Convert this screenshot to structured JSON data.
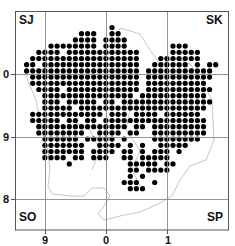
{
  "map": {
    "type": "grid-square distribution map",
    "square_labels": {
      "top_left": "SJ",
      "top_right": "SK",
      "bottom_left": "SO",
      "bottom_right": "SP"
    },
    "y_ticks": [
      {
        "label": "0",
        "y": 74
      },
      {
        "label": "9",
        "y": 137
      },
      {
        "label": "8",
        "y": 199
      }
    ],
    "x_ticks": [
      {
        "label": "9",
        "x": 45
      },
      {
        "label": "0",
        "x": 106
      },
      {
        "label": "1",
        "x": 167
      }
    ],
    "colors": {
      "dot": "#000000",
      "grid": "#8a8a8a",
      "frame": "#555555",
      "boundary": "#b5b5b5",
      "background": "#ffffff"
    },
    "grid": {
      "x0": 20.5,
      "y0": 27.5,
      "dx": 6.1,
      "dy": 6.2,
      "dot_r": 2.6
    },
    "rows": [
      "...............#..................",
      "..........###..##.................",
      ".........####.####................",
      ".....########.####.......###......",
      "...####.############.....#####....",
      "..##################...#######....",
      ".##.################..######.#.##.",
      ".###################.###########..",
      "..##################.###########..",
      "..##################.##########...",
      "...####.############.###########..",
      "....###############.###########...",
      "....###.#####.##.###############..",
      "....#####.#####################...",
      "..############.###.####.######....",
      "..#####.##.##.#################...",
      "...###############.##.#########...",
      "...########..####.##..#########...",
      "....######.#####.#....########....",
      "....#######..####.#.#..#####......",
      "....#######.####.##.#.###.#.......",
      "....####.##.###..##.#####.........",
      "........#.........#####.##........",
      "..................##.####.........",
      "..................#.#.............",
      ".................###..#...........",
      "..................###.............",
      "..................................",
      "..................................",
      ".................................."
    ]
  }
}
